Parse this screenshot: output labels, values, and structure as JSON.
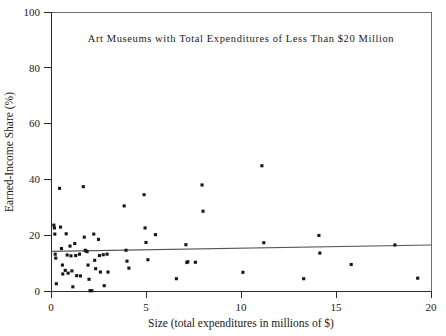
{
  "chart_data": {
    "type": "scatter",
    "title": "Art Museums with Total Expenditures of Less Than $20 Million",
    "xlabel": "Size (total expenditures in millions of $)",
    "ylabel": "Earned-Income Share (%)",
    "xlim": [
      0,
      20
    ],
    "ylim": [
      0,
      100
    ],
    "xticks": [
      0,
      5,
      10,
      15,
      20
    ],
    "yticks": [
      0,
      20,
      40,
      60,
      80,
      100
    ],
    "xtick_labels": [
      "0",
      "5",
      "10",
      "15",
      "20"
    ],
    "ytick_labels": [
      "0",
      "20",
      "40",
      "60",
      "80",
      "100"
    ],
    "grid": false,
    "legend": false,
    "marker": "square",
    "marker_color": "#161616",
    "trendline": {
      "label": "linear fit",
      "color": "#555555",
      "x_start": 0.0,
      "y_start": 14.2,
      "x_end": 20.0,
      "y_end": 16.5
    },
    "points": [
      {
        "x": 0.15,
        "y": 23.6
      },
      {
        "x": 0.18,
        "y": 22.6
      },
      {
        "x": 0.2,
        "y": 20.4
      },
      {
        "x": 0.22,
        "y": 13.2
      },
      {
        "x": 0.25,
        "y": 11.8
      },
      {
        "x": 0.28,
        "y": 2.6
      },
      {
        "x": 0.45,
        "y": 36.8
      },
      {
        "x": 0.5,
        "y": 22.9
      },
      {
        "x": 0.55,
        "y": 15.2
      },
      {
        "x": 0.6,
        "y": 9.3
      },
      {
        "x": 0.62,
        "y": 6.1
      },
      {
        "x": 0.75,
        "y": 7.4
      },
      {
        "x": 0.8,
        "y": 20.5
      },
      {
        "x": 0.85,
        "y": 12.9
      },
      {
        "x": 0.9,
        "y": 6.4
      },
      {
        "x": 1.0,
        "y": 16.1
      },
      {
        "x": 1.05,
        "y": 12.6
      },
      {
        "x": 1.1,
        "y": 7.2
      },
      {
        "x": 1.15,
        "y": 1.5
      },
      {
        "x": 1.25,
        "y": 17.0
      },
      {
        "x": 1.3,
        "y": 12.7
      },
      {
        "x": 1.35,
        "y": 5.5
      },
      {
        "x": 1.5,
        "y": 13.2
      },
      {
        "x": 1.55,
        "y": 5.4
      },
      {
        "x": 1.7,
        "y": 37.4
      },
      {
        "x": 1.75,
        "y": 19.3
      },
      {
        "x": 1.8,
        "y": 14.6
      },
      {
        "x": 1.85,
        "y": 14.3
      },
      {
        "x": 1.9,
        "y": 14.1
      },
      {
        "x": 1.95,
        "y": 9.3
      },
      {
        "x": 2.0,
        "y": 4.2
      },
      {
        "x": 2.05,
        "y": 0.1
      },
      {
        "x": 2.15,
        "y": 0.1
      },
      {
        "x": 2.25,
        "y": 20.4
      },
      {
        "x": 2.3,
        "y": 11.0
      },
      {
        "x": 2.35,
        "y": 8.0
      },
      {
        "x": 2.5,
        "y": 18.5
      },
      {
        "x": 2.55,
        "y": 12.7
      },
      {
        "x": 2.6,
        "y": 6.8
      },
      {
        "x": 2.75,
        "y": 13.0
      },
      {
        "x": 2.8,
        "y": 1.9
      },
      {
        "x": 2.95,
        "y": 13.2
      },
      {
        "x": 3.0,
        "y": 6.8
      },
      {
        "x": 3.85,
        "y": 30.5
      },
      {
        "x": 3.95,
        "y": 14.6
      },
      {
        "x": 4.0,
        "y": 10.7
      },
      {
        "x": 4.1,
        "y": 8.2
      },
      {
        "x": 4.9,
        "y": 34.5
      },
      {
        "x": 4.95,
        "y": 22.6
      },
      {
        "x": 5.0,
        "y": 17.4
      },
      {
        "x": 5.1,
        "y": 11.2
      },
      {
        "x": 5.5,
        "y": 20.2
      },
      {
        "x": 6.6,
        "y": 4.4
      },
      {
        "x": 7.1,
        "y": 16.6
      },
      {
        "x": 7.15,
        "y": 10.2
      },
      {
        "x": 7.2,
        "y": 10.5
      },
      {
        "x": 7.6,
        "y": 10.3
      },
      {
        "x": 7.95,
        "y": 38.0
      },
      {
        "x": 8.0,
        "y": 28.6
      },
      {
        "x": 10.1,
        "y": 6.7
      },
      {
        "x": 11.1,
        "y": 44.9
      },
      {
        "x": 11.2,
        "y": 17.3
      },
      {
        "x": 13.3,
        "y": 4.4
      },
      {
        "x": 14.1,
        "y": 19.9
      },
      {
        "x": 14.15,
        "y": 13.6
      },
      {
        "x": 15.8,
        "y": 9.5
      },
      {
        "x": 18.1,
        "y": 16.5
      },
      {
        "x": 19.3,
        "y": 4.6
      }
    ]
  }
}
